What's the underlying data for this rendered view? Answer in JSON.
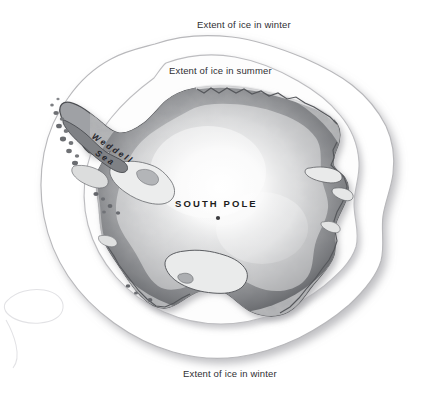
{
  "figure": {
    "background_color": "#ffffff",
    "width": 429,
    "height": 395
  },
  "labels": {
    "winter_top": "Extent of ice in winter",
    "winter_bottom": "Extent of ice in winter",
    "summer": "Extent of ice in summer",
    "south_pole": "SOUTH POLE",
    "weddell_line1": "Weddell",
    "weddell_line2": "Sea"
  },
  "colors": {
    "background": "#ffffff",
    "label_text": "#2f2f33",
    "south_pole_text": "#1d1d20",
    "winter_extent_fill": "#ffffff",
    "winter_extent_stroke": "#b8b8bb",
    "summer_extent_fill": "#fdfdfd",
    "summer_extent_stroke": "#bdbdc0",
    "continent_dark": "#6f7175",
    "continent_mid": "#9b9da1",
    "continent_light": "#f2f2f2",
    "coastline_stroke": "#4d4f53",
    "ice_shelf_fill": "#e9eaea",
    "shadow": "#c9c9cc",
    "pole_dot": "#3a3a3e"
  },
  "map_features": {
    "regions": [
      {
        "name": "winter-ice-extent",
        "label": "Extent of ice in winter"
      },
      {
        "name": "summer-ice-extent",
        "label": "Extent of ice in summer"
      },
      {
        "name": "antarctic-continent",
        "label": "Antarctica"
      },
      {
        "name": "filchner-ronne-ice-shelf",
        "label": ""
      },
      {
        "name": "ross-ice-shelf",
        "label": ""
      },
      {
        "name": "amery-ice-shelf",
        "label": ""
      },
      {
        "name": "antarctic-peninsula",
        "label": ""
      },
      {
        "name": "weddell-sea",
        "label": "Weddell Sea"
      },
      {
        "name": "south-pole-marker",
        "label": "SOUTH POLE"
      },
      {
        "name": "outlying-ice-contour",
        "label": ""
      }
    ]
  }
}
